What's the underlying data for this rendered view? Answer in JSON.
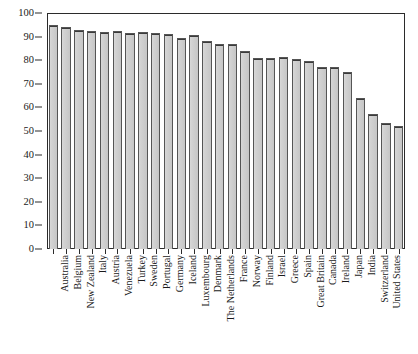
{
  "chart_data": {
    "type": "bar",
    "title": "",
    "xlabel": "",
    "ylabel": "",
    "ylim": [
      0,
      100
    ],
    "yticks": [
      0,
      10,
      20,
      30,
      40,
      50,
      60,
      70,
      80,
      90,
      100
    ],
    "grid": false,
    "legend": false,
    "bar_color": "#d0d0d0",
    "bar_edge_color": "#3a3a3a",
    "categories": [
      "Australia",
      "Belgium",
      "New Zealand",
      "Italy",
      "Austria",
      "Venezuela",
      "Turkey",
      "Sweden",
      "Portugal",
      "Germany",
      "Iceland",
      "Luxembourg",
      "Denmark",
      "The Netherlands",
      "France",
      "Norway",
      "Finland",
      "Israel",
      "Greece",
      "Spain",
      "Great Britain",
      "Canada",
      "Ireland",
      "Japan",
      "India",
      "Switzerland",
      "United States",
      "Colombia"
    ],
    "values": [
      95,
      94,
      93,
      92.5,
      92,
      92.5,
      91.5,
      92,
      91.5,
      91,
      89.5,
      90.5,
      88,
      87,
      87,
      84,
      81,
      81,
      81.5,
      80.5,
      79.5,
      77,
      77,
      75,
      64,
      57,
      53.5,
      52
    ]
  }
}
